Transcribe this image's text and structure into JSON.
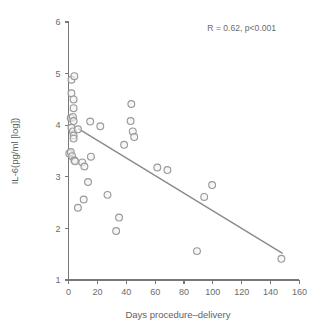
{
  "chart_data": {
    "type": "scatter",
    "title": "",
    "xlabel": "Days procedure–delivery",
    "ylabel": "IL-6(pg/ml [log])",
    "xlim": [
      -8,
      168
    ],
    "ylim": [
      1,
      6
    ],
    "xticks": [
      0,
      20,
      40,
      60,
      80,
      100,
      120,
      140,
      160
    ],
    "xtick_labels": [
      "0",
      "20",
      "40",
      "60",
      "80",
      "100",
      "120",
      "140",
      "160"
    ],
    "yticks": [
      1,
      2,
      3,
      4,
      5,
      6
    ],
    "ytick_labels": [
      "1",
      "2",
      "3",
      "4",
      "5",
      "6"
    ],
    "grid": false,
    "legend": null,
    "annotations": [
      {
        "name": "correlation-annotation",
        "text": "R = 0.62, p<0.001",
        "x": 120,
        "y": 5.82
      }
    ],
    "marker": {
      "shape": "open-circle",
      "radius_px": 3.4,
      "edge_color": "#9a9a9a",
      "face_color": "#f2f2f2"
    },
    "series": [
      {
        "name": "IL-6 by days procedure-delivery",
        "points": [
          [
            2.0,
            4.88
          ],
          [
            4.0,
            4.95
          ],
          [
            2.0,
            4.62
          ],
          [
            3.5,
            4.5
          ],
          [
            3.5,
            4.33
          ],
          [
            1.5,
            4.14
          ],
          [
            3.0,
            4.16
          ],
          [
            3.5,
            4.08
          ],
          [
            2.0,
            3.95
          ],
          [
            3.0,
            3.88
          ],
          [
            6.5,
            3.92
          ],
          [
            3.5,
            3.8
          ],
          [
            3.5,
            3.74
          ],
          [
            15.0,
            4.07
          ],
          [
            22.0,
            3.98
          ],
          [
            0.5,
            3.45
          ],
          [
            1.5,
            3.48
          ],
          [
            2.5,
            3.4
          ],
          [
            4.0,
            3.32
          ],
          [
            4.5,
            3.3
          ],
          [
            9.5,
            3.28
          ],
          [
            11.0,
            3.2
          ],
          [
            15.5,
            3.39
          ],
          [
            13.5,
            2.9
          ],
          [
            6.5,
            2.4
          ],
          [
            10.5,
            2.56
          ],
          [
            27.0,
            2.65
          ],
          [
            35.0,
            2.21
          ],
          [
            33.0,
            1.95
          ],
          [
            38.5,
            3.62
          ],
          [
            43.5,
            4.41
          ],
          [
            43.0,
            4.08
          ],
          [
            44.5,
            3.88
          ],
          [
            45.5,
            3.77
          ],
          [
            61.5,
            3.18
          ],
          [
            68.5,
            3.13
          ],
          [
            89.0,
            1.56
          ],
          [
            94.0,
            2.61
          ],
          [
            99.5,
            2.84
          ],
          [
            147.5,
            1.41
          ]
        ]
      }
    ],
    "fit_line": {
      "name": "regression-line",
      "color": "#8a8a8a",
      "x_start": 7.0,
      "y_start": 3.93,
      "x_end": 148.0,
      "y_end": 1.52
    }
  }
}
